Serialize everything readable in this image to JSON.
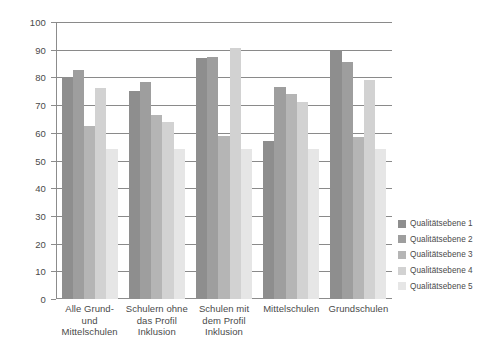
{
  "chart_data": {
    "type": "bar",
    "title": "",
    "subtitle": "",
    "xlabel": "",
    "ylabel": "",
    "ylim": [
      0,
      100
    ],
    "y_ticks": [
      0,
      10,
      20,
      30,
      40,
      50,
      60,
      70,
      80,
      90,
      100
    ],
    "grid": true,
    "legend_position": "right",
    "categories": [
      "Alle Grund- und Mittelschulen",
      "Schulern ohne das Profil Inklusion",
      "Schulen mit dem Profil Inklusion",
      "Mittelschulen",
      "Grundschulen"
    ],
    "category_lines": [
      [
        "Alle Grund-",
        "und",
        "Mittelschulen"
      ],
      [
        "Schulern ohne",
        "das Profil",
        "Inklusion"
      ],
      [
        "Schulen mit",
        "dem Profil",
        "Inklusion"
      ],
      [
        "Mittelschulen"
      ],
      [
        "Grundschulen"
      ]
    ],
    "series": [
      {
        "name": "Qualitätsebene 1",
        "color": "#8e8e8e",
        "values": [
          80,
          75,
          87,
          57,
          90
        ]
      },
      {
        "name": "Qualitätsebene 2",
        "color": "#9e9e9e",
        "values": [
          82.5,
          78.5,
          87.5,
          76.5,
          85.5
        ]
      },
      {
        "name": "Qualitätsebene 3",
        "color": "#b5b5b5",
        "values": [
          62.5,
          66.5,
          59,
          74,
          58.5
        ]
      },
      {
        "name": "Qualitätsebene 4",
        "color": "#d2d2d2",
        "values": [
          76,
          64,
          90.5,
          71,
          79
        ]
      },
      {
        "name": "Qualitätsebene 5",
        "color": "#e6e6e6",
        "values": [
          54,
          54,
          54,
          54,
          54
        ]
      }
    ],
    "legend": [
      {
        "label": "Qualitätsebene 1",
        "color": "#8e8e8e"
      },
      {
        "label": "Qualitätsebene 2",
        "color": "#9e9e9e"
      },
      {
        "label": "Qualitätsebene 3",
        "color": "#b5b5b5"
      },
      {
        "label": "Qualitätsebene 4",
        "color": "#d2d2d2"
      },
      {
        "label": "Qualitätsebene 5",
        "color": "#e6e6e6"
      }
    ],
    "axis_color": "#8c8c8c",
    "grid_color": "#8a8a8a",
    "background": "#ffffff"
  }
}
